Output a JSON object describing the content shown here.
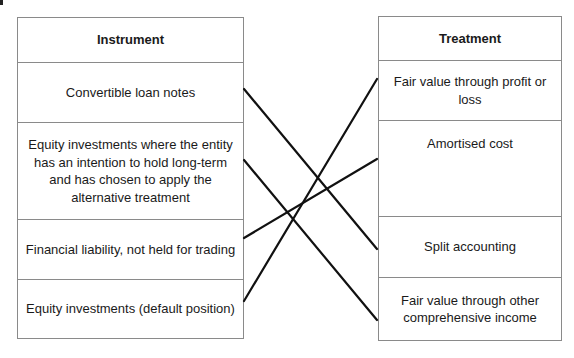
{
  "diagram": {
    "left_column": {
      "header": "Instrument",
      "items": [
        "Convertible loan notes",
        "Equity investments where the entity has an intention to hold long-term and has chosen to apply the alternative treatment",
        "Financial liability, not held for trading",
        "Equity investments (default position)"
      ]
    },
    "right_column": {
      "header": "Treatment",
      "items": [
        "Fair value through profit or loss",
        "Amortised cost",
        "Split accounting",
        "Fair value through other comprehensive income"
      ]
    },
    "connections": [
      {
        "from": "Convertible loan notes",
        "to": "Split accounting"
      },
      {
        "from": "Equity investments where the entity has an intention to hold long-term and has chosen to apply the alternative treatment",
        "to": "Fair value through other comprehensive income"
      },
      {
        "from": "Financial liability, not held for trading",
        "to": "Amortised cost"
      },
      {
        "from": "Equity investments (default position)",
        "to": "Fair value through profit or loss"
      }
    ],
    "line_color": "#111111",
    "border_color": "#8a8a8a"
  }
}
